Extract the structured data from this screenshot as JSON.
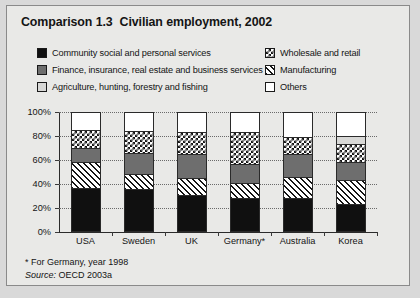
{
  "figure": {
    "title_main": "Comparison 1.3",
    "title_sub": "Civilian employment, 2002",
    "footnote": "* For Germany, year 1998",
    "source_label": "Source:",
    "source_value": "OECD 2003a"
  },
  "legend": {
    "items": [
      {
        "label": "Community social and personal services",
        "pattern": "f-black",
        "swatch_name": "legend-swatch-community"
      },
      {
        "label": "Finance, insurance, real estate and business services",
        "pattern": "f-gray",
        "swatch_name": "legend-swatch-finance"
      },
      {
        "label": "Agriculture, hunting, forestry and fishing",
        "pattern": "f-lgray",
        "swatch_name": "legend-swatch-agriculture"
      },
      {
        "label": "Wholesale and retail",
        "pattern": "f-check",
        "swatch_name": "legend-swatch-wholesale"
      },
      {
        "label": "Manufacturing",
        "pattern": "f-hatch",
        "swatch_name": "legend-swatch-manufacturing"
      },
      {
        "label": "Others",
        "pattern": "f-white",
        "swatch_name": "legend-swatch-others"
      }
    ]
  },
  "chart_data": {
    "type": "bar",
    "stacked": true,
    "normalized_100pct": true,
    "xlabel": "",
    "ylabel": "",
    "ylim": [
      0,
      100
    ],
    "yticks": [
      0,
      20,
      40,
      60,
      80,
      100
    ],
    "ytick_labels": [
      "0%",
      "20%",
      "40%",
      "60%",
      "80%",
      "100%"
    ],
    "grid": true,
    "grid_style": "dotted-horizontal",
    "legend_position": "top",
    "categories": [
      "USA",
      "Sweden",
      "UK",
      "Germany*",
      "Australia",
      "Korea"
    ],
    "series": [
      {
        "name": "Community social and personal services",
        "pattern": "f-black",
        "values": [
          37,
          36,
          31,
          28,
          28,
          23
        ]
      },
      {
        "name": "Manufacturing",
        "pattern": "f-hatch",
        "values": [
          21,
          12,
          14,
          13,
          18,
          20
        ]
      },
      {
        "name": "Finance, insurance, real estate and business services",
        "pattern": "f-gray",
        "values": [
          12,
          18,
          20,
          16,
          19,
          15
        ]
      },
      {
        "name": "Wholesale and retail",
        "pattern": "f-check",
        "values": [
          15,
          18,
          18,
          26,
          14,
          15
        ]
      },
      {
        "name": "Agriculture, hunting, forestry and fishing",
        "pattern": "f-lgray",
        "values": [
          0,
          0,
          0,
          0,
          0,
          7
        ]
      },
      {
        "name": "Others",
        "pattern": "f-white",
        "values": [
          15,
          16,
          17,
          17,
          21,
          20
        ]
      }
    ]
  }
}
